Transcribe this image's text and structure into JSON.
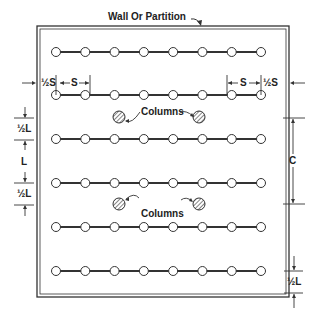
{
  "diagram": {
    "wall_label": "Wall Or Partition",
    "columns_label_top": "Columns",
    "columns_label_bottom": "Columns",
    "dimensions": {
      "half_s_left": "½S",
      "s_left": "S",
      "s_right": "S",
      "half_s_right": "½S",
      "half_l_upper": "½L",
      "l": "L",
      "half_l_lower": "½L",
      "c": "C",
      "half_l_bottom": "½L"
    },
    "rows": 6,
    "fixtures_per_row": 8
  }
}
